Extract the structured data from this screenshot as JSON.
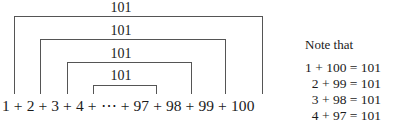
{
  "diagram": {
    "sum_expression": "1 + 2 + 3 + 4 + ⋯ + 97 + 98 + 99 + 100",
    "brackets": [
      {
        "label": "101",
        "left_term": "1",
        "right_term": "100"
      },
      {
        "label": "101",
        "left_term": "2",
        "right_term": "99"
      },
      {
        "label": "101",
        "left_term": "3",
        "right_term": "98"
      },
      {
        "label": "101",
        "left_term": "4",
        "right_term": "97"
      }
    ]
  },
  "note": {
    "title": "Note that",
    "equations": [
      "1 + 100 = 101",
      "2 + 99 = 101",
      "3 + 98 = 101",
      "4 + 97 = 101"
    ]
  },
  "colors": {
    "text": "#1a1a1a",
    "bracket_line": "#555555",
    "background": "#ffffff"
  }
}
